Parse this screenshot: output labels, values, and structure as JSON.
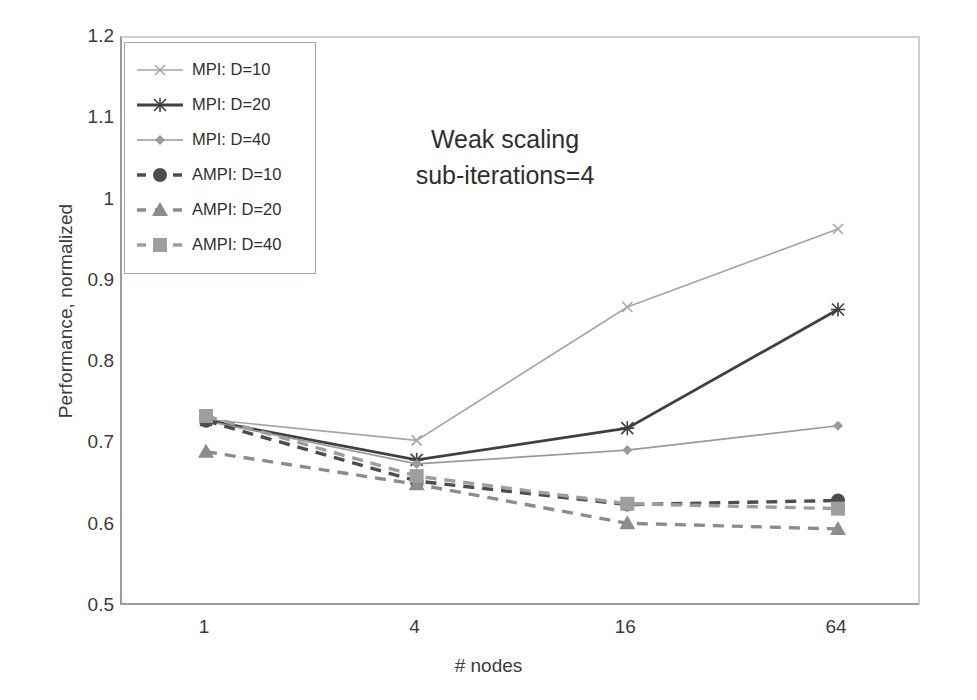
{
  "chart_data": {
    "type": "line",
    "title": "Weak scaling\nsub-iterations=4",
    "title_line1": "Weak scaling",
    "title_line2": "sub-iterations=4",
    "xlabel": "# nodes",
    "ylabel": "Performance, normalized",
    "categories": [
      "1",
      "4",
      "16",
      "64"
    ],
    "x": [
      1,
      4,
      16,
      64
    ],
    "ylim": [
      0.5,
      1.2
    ],
    "yticks": [
      "0.5",
      "0.6",
      "0.7",
      "0.8",
      "0.9",
      "1",
      "1.1",
      "1.2"
    ],
    "ytick_values": [
      0.5,
      0.6,
      0.7,
      0.8,
      0.9,
      1.0,
      1.1,
      1.2
    ],
    "grid": false,
    "legend_position": "top-left-inside",
    "series": [
      {
        "name": "MPI: D=10",
        "values": [
          0.731,
          0.705,
          0.869,
          0.965
        ],
        "color": "#a6a6a6",
        "dash": "solid",
        "marker": "x"
      },
      {
        "name": "MPI: D=20",
        "values": [
          0.73,
          0.681,
          0.72,
          0.866
        ],
        "color": "#404040",
        "dash": "solid",
        "marker": "star"
      },
      {
        "name": "MPI: D=40",
        "values": [
          0.729,
          0.676,
          0.693,
          0.723
        ],
        "color": "#9a9a9a",
        "dash": "solid",
        "marker": "diamond"
      },
      {
        "name": "AMPI: D=10",
        "values": [
          0.729,
          0.655,
          0.626,
          0.631
        ],
        "color": "#4d4d4d",
        "dash": "dashed",
        "marker": "circle"
      },
      {
        "name": "AMPI: D=20",
        "values": [
          0.691,
          0.651,
          0.603,
          0.596
        ],
        "color": "#8c8c8c",
        "dash": "dashed",
        "marker": "triangle"
      },
      {
        "name": "AMPI: D=40",
        "values": [
          0.735,
          0.661,
          0.627,
          0.621
        ],
        "color": "#9e9e9e",
        "dash": "dashed",
        "marker": "square"
      }
    ]
  }
}
